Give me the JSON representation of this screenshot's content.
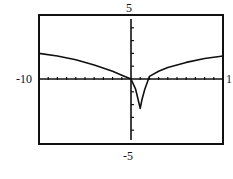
{
  "chart_data": {
    "type": "line",
    "title": "",
    "xlabel": "",
    "ylabel": "",
    "xlim": [
      -10,
      10
    ],
    "ylim": [
      -5,
      5
    ],
    "grid": false,
    "legend": null,
    "x_tick_step": 1,
    "y_tick_step": 1,
    "window_labels": {
      "xmin": "-10",
      "xmax": "1",
      "ymin": "-5",
      "ymax": "5"
    },
    "series": [
      {
        "name": "f(x)",
        "x": [
          -10,
          -8,
          -6,
          -4,
          -2,
          -1,
          0,
          0.5,
          0.8,
          1.0,
          1.2,
          1.5,
          2,
          3,
          4,
          6,
          8,
          10
        ],
        "y": [
          2.0,
          1.8,
          1.5,
          1.1,
          0.6,
          0.3,
          0.0,
          -0.8,
          -1.7,
          -2.3,
          -1.6,
          -0.8,
          0.2,
          0.6,
          0.9,
          1.3,
          1.6,
          1.8
        ]
      }
    ]
  },
  "colors": {
    "ink": "#111111",
    "background": "#ffffff"
  }
}
